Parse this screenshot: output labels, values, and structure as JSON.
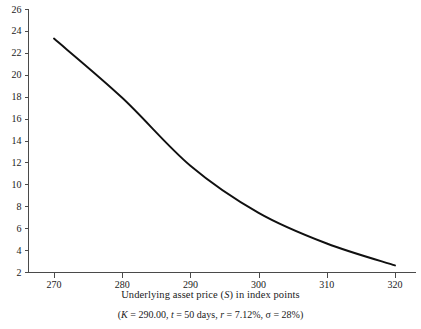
{
  "chart_data": {
    "type": "line",
    "title": "",
    "subtitle": "(K = 290.00, t = 50 days, r = 7.12%, σ = 28%)",
    "xlabel": "Underlying asset price (S) in index points",
    "ylabel": "",
    "x": [
      270,
      280,
      290,
      300,
      310,
      320
    ],
    "values": [
      23.3,
      17.9,
      11.7,
      7.4,
      4.6,
      2.6
    ],
    "series": [
      {
        "name": "Option price",
        "values": [
          23.3,
          17.9,
          11.7,
          7.4,
          4.6,
          2.6
        ]
      }
    ],
    "xlim": [
      266,
      324
    ],
    "ylim": [
      2,
      26
    ],
    "xticks": [
      270,
      280,
      290,
      300,
      310,
      320
    ],
    "xtick_labels": [
      "270",
      "280",
      "290",
      "300",
      "310",
      "320"
    ],
    "yticks": [
      2,
      4,
      6,
      8,
      10,
      12,
      14,
      16,
      18,
      20,
      22,
      24,
      26
    ],
    "ytick_labels": [
      "2",
      "4",
      "6",
      "8",
      "10",
      "12",
      "14",
      "16",
      "18",
      "20",
      "22",
      "24",
      "26"
    ],
    "grid": false,
    "legend": null,
    "line_color": "#101010",
    "axis_color": "#4a4a4a",
    "background_color": "#ffffff"
  },
  "axis_label": {
    "text_before": "Underlying asset price (",
    "symbol": "S",
    "text_after": ") in index points"
  },
  "subtitle_parts": {
    "open_paren": "(",
    "k_symbol": "K",
    "k_value": " = 290.00, ",
    "t_symbol": "t",
    "t_value": " = 50 days, ",
    "r_symbol": "r",
    "r_value": " = 7.12%, ",
    "sigma_symbol": "σ",
    "sigma_value": " = 28%",
    "close_paren": ")"
  }
}
